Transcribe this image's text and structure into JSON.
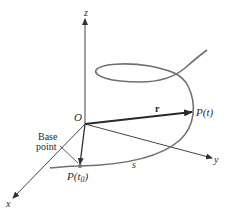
{
  "figure": {
    "axes": {
      "x_label": "x",
      "y_label": "y",
      "z_label": "z",
      "origin_label": "O"
    },
    "vector": {
      "label": "r"
    },
    "points": {
      "p_t": "P(t)",
      "p_t0_prefix": "P(t",
      "p_t0_sub": "0",
      "p_t0_suffix": ")"
    },
    "arc_length_label": "s",
    "base_point_label": {
      "line1": "Base",
      "line2": "point"
    },
    "colors": {
      "curve": "#707070",
      "axes": "#303030",
      "vector": "#2a2a2a",
      "text": "#2a2a2a"
    }
  }
}
